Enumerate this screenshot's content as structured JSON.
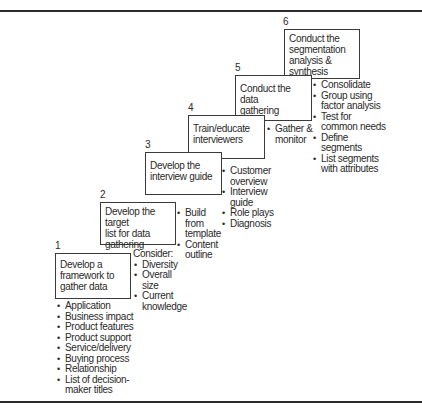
{
  "diagram": {
    "steps": [
      {
        "number": "1",
        "title": "Develop a\nframework to\ngather data",
        "details": [
          "Application",
          "Business impact",
          "Product features",
          "Product support",
          "Service/delivery",
          "Buying process",
          "Relationship",
          "List of decision-\nmaker titles"
        ]
      },
      {
        "number": "2",
        "title": "Develop the target\nlist for data\ngathering",
        "details_heading": "Consider:",
        "details": [
          "Diversity",
          "Overall\nsize",
          "Current\nknowledge"
        ]
      },
      {
        "number": "3",
        "title": "Develop the\ninterview guide",
        "details": [
          "Build\nfrom\ntemplate",
          "Content\noutline"
        ]
      },
      {
        "number": "4",
        "title": "Train/educate\ninterviewers",
        "details": [
          "Customer\noverview",
          "Interview\nguide",
          "Role plays",
          "Diagnosis"
        ]
      },
      {
        "number": "5",
        "title": "Conduct the data\ngathering",
        "details": [
          "Gather &\nmonitor"
        ]
      },
      {
        "number": "6",
        "title": "Conduct the\nsegmentation\nanalysis &\nsynthesis",
        "details": [
          "Consolidate",
          "Group using\nfactor analysis",
          "Test for\ncommon needs",
          "Define\nsegments",
          "List segments\nwith attributes"
        ]
      }
    ]
  }
}
